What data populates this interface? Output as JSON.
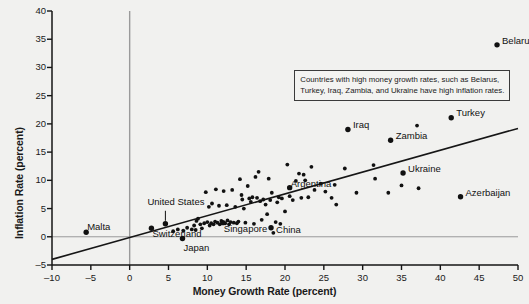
{
  "chart_data": {
    "type": "scatter",
    "title": "",
    "xlabel": "Money Growth Rate (percent)",
    "ylabel": "Inflation Rate (percent)",
    "xlim": [
      -10,
      50
    ],
    "ylim": [
      -5,
      40
    ],
    "xticks": [
      -10,
      -5,
      0,
      5,
      10,
      15,
      20,
      25,
      30,
      35,
      40,
      45,
      50
    ],
    "yticks": [
      -5,
      0,
      5,
      10,
      15,
      20,
      25,
      30,
      35,
      40
    ],
    "xtick_labels": [
      "–10",
      "–5",
      "0",
      "5",
      "10",
      "15",
      "20",
      "25",
      "30",
      "35",
      "40",
      "45",
      "50"
    ],
    "ytick_labels": [
      "–5",
      "0",
      "5",
      "10",
      "15",
      "20",
      "25",
      "30",
      "35",
      "40"
    ],
    "grid": false,
    "legend": "none",
    "reference_lines": [
      {
        "name": "zero-inflation-line",
        "orientation": "horizontal",
        "value": 0,
        "color": "#9a9a9a"
      },
      {
        "name": "zero-money-growth-line",
        "orientation": "vertical",
        "value": 0,
        "color": "#9a9a9a"
      }
    ],
    "trendline": {
      "name": "regression-line",
      "x_start": -10,
      "y_start": -4.0,
      "x_end": 50,
      "y_end": 19.2,
      "color": "#161616"
    },
    "annotation": {
      "line1": "Countries with high money growth rates, such as Belarus,",
      "line2": "Turkey, Iraq, Zambia, and Ukraine have high inflation rates."
    },
    "labeled_points": [
      {
        "label": "Belarus",
        "x": 47.3,
        "y": 34.0,
        "label_dx": 5,
        "label_dy": -4
      },
      {
        "label": "Turkey",
        "x": 41.4,
        "y": 21.1,
        "label_dx": 5,
        "label_dy": -5
      },
      {
        "label": "Iraq",
        "x": 28.1,
        "y": 19.0,
        "label_dx": 5,
        "label_dy": -5
      },
      {
        "label": "Zambia",
        "x": 33.6,
        "y": 17.1,
        "label_dx": 5,
        "label_dy": -4
      },
      {
        "label": "Ukraine",
        "x": 35.2,
        "y": 11.3,
        "label_dx": 5,
        "label_dy": -4
      },
      {
        "label": "Azerbaijan",
        "x": 42.6,
        "y": 7.1,
        "label_dx": 5,
        "label_dy": -4
      },
      {
        "label": "Argentina",
        "x": 20.6,
        "y": 8.7,
        "label_dx": 1,
        "label_dy": -4
      },
      {
        "label": "China",
        "x": 18.2,
        "y": 1.6,
        "label_dx": 5,
        "label_dy": 2
      },
      {
        "label": "Singapore",
        "x": 12.0,
        "y": 2.5,
        "label_dx": 1,
        "label_dy": 6
      },
      {
        "label": "Japan",
        "x": 6.8,
        "y": -0.3,
        "label_dx": 1,
        "label_dy": 10
      },
      {
        "label": "Switzerland",
        "x": 2.8,
        "y": 1.5,
        "label_dx": 1,
        "label_dy": 6
      },
      {
        "label": "Malta",
        "x": -5.6,
        "y": 0.8,
        "label_dx": 1,
        "label_dy": -5
      },
      {
        "label": "United States",
        "x": 4.6,
        "y": 2.3,
        "label_dx": -18,
        "label_dy": -22,
        "leader": true
      }
    ],
    "points": [
      {
        "x": 5.6,
        "y": 1.0
      },
      {
        "x": 6.2,
        "y": 1.3
      },
      {
        "x": 6.9,
        "y": 1.1
      },
      {
        "x": 7.4,
        "y": 1.6
      },
      {
        "x": 8.0,
        "y": 1.3
      },
      {
        "x": 8.3,
        "y": 2.0
      },
      {
        "x": 8.5,
        "y": 1.2
      },
      {
        "x": 8.6,
        "y": 2.8
      },
      {
        "x": 8.8,
        "y": 3.2
      },
      {
        "x": 9.1,
        "y": 2.2
      },
      {
        "x": 9.3,
        "y": 1.5
      },
      {
        "x": 9.6,
        "y": 2.4
      },
      {
        "x": 9.8,
        "y": 7.9
      },
      {
        "x": 10.0,
        "y": 2.6
      },
      {
        "x": 10.2,
        "y": 5.3
      },
      {
        "x": 10.3,
        "y": 2.0
      },
      {
        "x": 10.5,
        "y": 2.4
      },
      {
        "x": 10.6,
        "y": 5.9
      },
      {
        "x": 10.8,
        "y": 2.2
      },
      {
        "x": 11.0,
        "y": 2.7
      },
      {
        "x": 11.1,
        "y": 8.4
      },
      {
        "x": 11.3,
        "y": 2.5
      },
      {
        "x": 11.5,
        "y": 5.5
      },
      {
        "x": 11.6,
        "y": 2.2
      },
      {
        "x": 11.8,
        "y": 2.8
      },
      {
        "x": 12.1,
        "y": 8.1
      },
      {
        "x": 12.3,
        "y": 2.4
      },
      {
        "x": 12.5,
        "y": 5.6
      },
      {
        "x": 12.6,
        "y": 2.9
      },
      {
        "x": 12.8,
        "y": 2.2
      },
      {
        "x": 13.0,
        "y": 2.6
      },
      {
        "x": 13.2,
        "y": 8.3
      },
      {
        "x": 13.4,
        "y": 2.5
      },
      {
        "x": 13.6,
        "y": 5.3
      },
      {
        "x": 13.8,
        "y": 2.4
      },
      {
        "x": 14.0,
        "y": 2.7
      },
      {
        "x": 14.2,
        "y": 10.2
      },
      {
        "x": 14.4,
        "y": 7.4
      },
      {
        "x": 14.5,
        "y": 6.6
      },
      {
        "x": 14.7,
        "y": 5.0
      },
      {
        "x": 14.9,
        "y": 2.5
      },
      {
        "x": 15.2,
        "y": 9.0
      },
      {
        "x": 15.4,
        "y": 6.8
      },
      {
        "x": 15.6,
        "y": 6.2
      },
      {
        "x": 15.8,
        "y": 7.0
      },
      {
        "x": 16.0,
        "y": 2.3
      },
      {
        "x": 16.2,
        "y": 10.6
      },
      {
        "x": 16.4,
        "y": 6.9
      },
      {
        "x": 16.6,
        "y": 11.5
      },
      {
        "x": 16.8,
        "y": 6.3
      },
      {
        "x": 17.0,
        "y": 3.0
      },
      {
        "x": 17.2,
        "y": 6.6
      },
      {
        "x": 17.5,
        "y": 5.7
      },
      {
        "x": 17.7,
        "y": 4.0
      },
      {
        "x": 17.9,
        "y": 10.3
      },
      {
        "x": 18.1,
        "y": 6.5
      },
      {
        "x": 18.3,
        "y": 7.8
      },
      {
        "x": 18.5,
        "y": 0.7
      },
      {
        "x": 18.8,
        "y": 2.6
      },
      {
        "x": 19.0,
        "y": 6.1
      },
      {
        "x": 19.2,
        "y": 7.0
      },
      {
        "x": 19.4,
        "y": 2.3
      },
      {
        "x": 19.6,
        "y": 6.8
      },
      {
        "x": 20.0,
        "y": 4.5
      },
      {
        "x": 20.3,
        "y": 12.8
      },
      {
        "x": 20.6,
        "y": 7.2
      },
      {
        "x": 21.0,
        "y": 6.5
      },
      {
        "x": 21.4,
        "y": 9.9
      },
      {
        "x": 21.8,
        "y": 11.2
      },
      {
        "x": 22.1,
        "y": 6.9
      },
      {
        "x": 22.4,
        "y": 11.0
      },
      {
        "x": 22.6,
        "y": 10.0
      },
      {
        "x": 23.0,
        "y": 7.0
      },
      {
        "x": 23.4,
        "y": 12.4
      },
      {
        "x": 23.8,
        "y": 8.3
      },
      {
        "x": 24.6,
        "y": 9.4
      },
      {
        "x": 25.2,
        "y": 8.0
      },
      {
        "x": 26.0,
        "y": 6.9
      },
      {
        "x": 26.4,
        "y": 9.2
      },
      {
        "x": 26.6,
        "y": 5.7
      },
      {
        "x": 27.7,
        "y": 12.1
      },
      {
        "x": 29.2,
        "y": 7.8
      },
      {
        "x": 31.4,
        "y": 12.7
      },
      {
        "x": 31.6,
        "y": 10.3
      },
      {
        "x": 33.3,
        "y": 7.8
      },
      {
        "x": 35.0,
        "y": 9.1
      },
      {
        "x": 37.0,
        "y": 19.7
      },
      {
        "x": 37.2,
        "y": 8.6
      }
    ]
  }
}
